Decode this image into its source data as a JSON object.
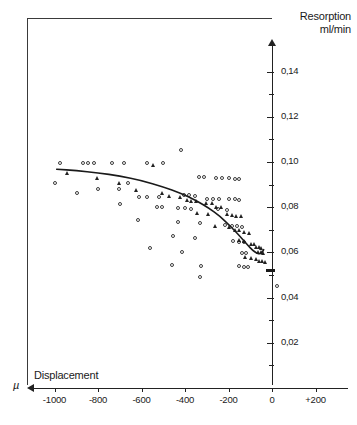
{
  "chart_data": {
    "type": "scatter",
    "title": "",
    "ylabel_line1": "Resorption",
    "ylabel_line2": "ml/min",
    "xlabel": "Displacement",
    "xunit": "µ",
    "xlim": [
      -1100,
      200
    ],
    "ylim": [
      0.0,
      0.15
    ],
    "grid": false,
    "legend": "none",
    "yticks": [
      0.02,
      0.04,
      0.06,
      0.08,
      0.1,
      0.12,
      0.14
    ],
    "ytick_labels": [
      "0,02",
      "0,04",
      "0,06",
      "0,08",
      "0,10",
      "0,12",
      "0,14"
    ],
    "yminor_ticks": [
      0.01,
      0.03,
      0.05,
      0.07,
      0.09,
      0.11,
      0.13
    ],
    "xticks": [
      -1000,
      -800,
      -600,
      -400,
      -200,
      0,
      200
    ],
    "xtick_labels": [
      "-1000",
      "-800",
      "-600",
      "-400",
      "-200",
      "0",
      "+200"
    ],
    "series": [
      {
        "name": "open-circles",
        "marker": "circle",
        "points": [
          [
            -975,
            0.0995
          ],
          [
            -870,
            0.0995
          ],
          [
            -845,
            0.0995
          ],
          [
            -820,
            0.0995
          ],
          [
            -735,
            0.0995
          ],
          [
            -680,
            0.0995
          ],
          [
            -575,
            0.0995
          ],
          [
            -500,
            0.0995
          ],
          [
            -420,
            0.1055
          ],
          [
            -335,
            0.0932
          ],
          [
            -312,
            0.0932
          ],
          [
            -258,
            0.093
          ],
          [
            -228,
            0.093
          ],
          [
            -196,
            0.0928
          ],
          [
            -168,
            0.0926
          ],
          [
            -150,
            0.0926
          ],
          [
            -895,
            0.0862
          ],
          [
            -800,
            0.088
          ],
          [
            -705,
            0.088
          ],
          [
            -612,
            0.0845
          ],
          [
            -575,
            0.0845
          ],
          [
            -520,
            0.0845
          ],
          [
            -406,
            0.0852
          ],
          [
            -380,
            0.0852
          ],
          [
            -352,
            0.085
          ],
          [
            -300,
            0.0838
          ],
          [
            -270,
            0.0838
          ],
          [
            -245,
            0.0836
          ],
          [
            -196,
            0.0836
          ],
          [
            -172,
            0.0836
          ],
          [
            -152,
            0.0834
          ],
          [
            -700,
            0.0812
          ],
          [
            -530,
            0.08
          ],
          [
            -505,
            0.08
          ],
          [
            -430,
            0.0795
          ],
          [
            -398,
            0.0795
          ],
          [
            -372,
            0.0793
          ],
          [
            -250,
            0.079
          ],
          [
            -206,
            0.0788
          ],
          [
            -615,
            0.0742
          ],
          [
            -430,
            0.0735
          ],
          [
            -330,
            0.073
          ],
          [
            -216,
            0.072
          ],
          [
            -186,
            0.0718
          ],
          [
            -160,
            0.0716
          ],
          [
            -140,
            0.0714
          ],
          [
            -455,
            0.0672
          ],
          [
            -352,
            0.0665
          ],
          [
            -180,
            0.065
          ],
          [
            -152,
            0.0648
          ],
          [
            -128,
            0.0646
          ],
          [
            -1000,
            0.0905
          ],
          [
            -660,
            0.0905
          ],
          [
            -560,
            0.062
          ],
          [
            -412,
            0.0602
          ],
          [
            -140,
            0.0598
          ],
          [
            -118,
            0.0596
          ],
          [
            -462,
            0.0545
          ],
          [
            -325,
            0.054
          ],
          [
            -150,
            0.0538
          ],
          [
            -128,
            0.0536
          ],
          [
            -110,
            0.0534
          ],
          [
            -330,
            0.049
          ],
          [
            25,
            0.0452
          ]
        ]
      },
      {
        "name": "filled-triangles",
        "marker": "triangle",
        "points": [
          [
            -940,
            0.095
          ],
          [
            -800,
            0.093
          ],
          [
            -700,
            0.0908
          ],
          [
            -622,
            0.0875
          ],
          [
            -505,
            0.0862
          ],
          [
            -470,
            0.0848
          ],
          [
            -420,
            0.0845
          ],
          [
            -390,
            0.083
          ],
          [
            -368,
            0.0828
          ],
          [
            -345,
            0.0826
          ],
          [
            -300,
            0.0818
          ],
          [
            -272,
            0.0816
          ],
          [
            -256,
            0.08
          ],
          [
            -232,
            0.0798
          ],
          [
            -340,
            0.0772
          ],
          [
            -292,
            0.0768
          ],
          [
            -205,
            0.0768
          ],
          [
            -182,
            0.0766
          ],
          [
            -162,
            0.076
          ],
          [
            -140,
            0.0758
          ],
          [
            -260,
            0.0718
          ],
          [
            -196,
            0.0712
          ],
          [
            -168,
            0.07
          ],
          [
            -148,
            0.0698
          ],
          [
            -124,
            0.0688
          ],
          [
            -104,
            0.0686
          ],
          [
            -150,
            0.0652
          ],
          [
            -126,
            0.065
          ],
          [
            -96,
            0.0638
          ],
          [
            -78,
            0.0636
          ],
          [
            -70,
            0.0625
          ],
          [
            -58,
            0.0622
          ],
          [
            -48,
            0.0618
          ],
          [
            -62,
            0.0602
          ],
          [
            -50,
            0.06
          ],
          [
            -40,
            0.0598
          ],
          [
            -120,
            0.0578
          ],
          [
            -92,
            0.0575
          ],
          [
            -70,
            0.0572
          ],
          [
            -58,
            0.0562
          ],
          [
            -44,
            0.056
          ],
          [
            -30,
            0.0558
          ],
          [
            -545,
            0.0985
          ]
        ]
      },
      {
        "name": "axis-bar-marker",
        "marker": "bar",
        "points": [
          [
            -8,
            0.0522
          ]
        ]
      }
    ],
    "fit_curve": {
      "name": "regression-curve",
      "points": [
        [
          -990,
          0.0968
        ],
        [
          -900,
          0.0962
        ],
        [
          -800,
          0.0952
        ],
        [
          -700,
          0.0938
        ],
        [
          -600,
          0.0918
        ],
        [
          -500,
          0.089
        ],
        [
          -420,
          0.0862
        ],
        [
          -350,
          0.083
        ],
        [
          -290,
          0.0796
        ],
        [
          -240,
          0.076
        ],
        [
          -200,
          0.0724
        ],
        [
          -165,
          0.069
        ],
        [
          -135,
          0.0658
        ],
        [
          -110,
          0.063
        ],
        [
          -90,
          0.061
        ],
        [
          -72,
          0.0598
        ],
        [
          -58,
          0.0592
        ],
        [
          -46,
          0.06
        ],
        [
          -38,
          0.0612
        ]
      ]
    }
  }
}
